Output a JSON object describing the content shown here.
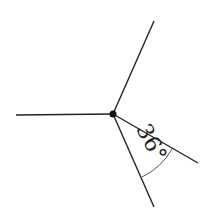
{
  "diagram": {
    "center": {
      "x": 113,
      "y": 114
    },
    "rays": [
      {
        "name": "left",
        "end": {
          "x": 16,
          "y": 115
        }
      },
      {
        "name": "upper",
        "end": {
          "x": 154,
          "y": 21
        }
      },
      {
        "name": "lower-right",
        "end": {
          "x": 198,
          "y": 163
        }
      },
      {
        "name": "lower",
        "end": {
          "x": 154,
          "y": 207
        }
      }
    ],
    "angle_label": "36°",
    "stroke_color": "#222222"
  }
}
